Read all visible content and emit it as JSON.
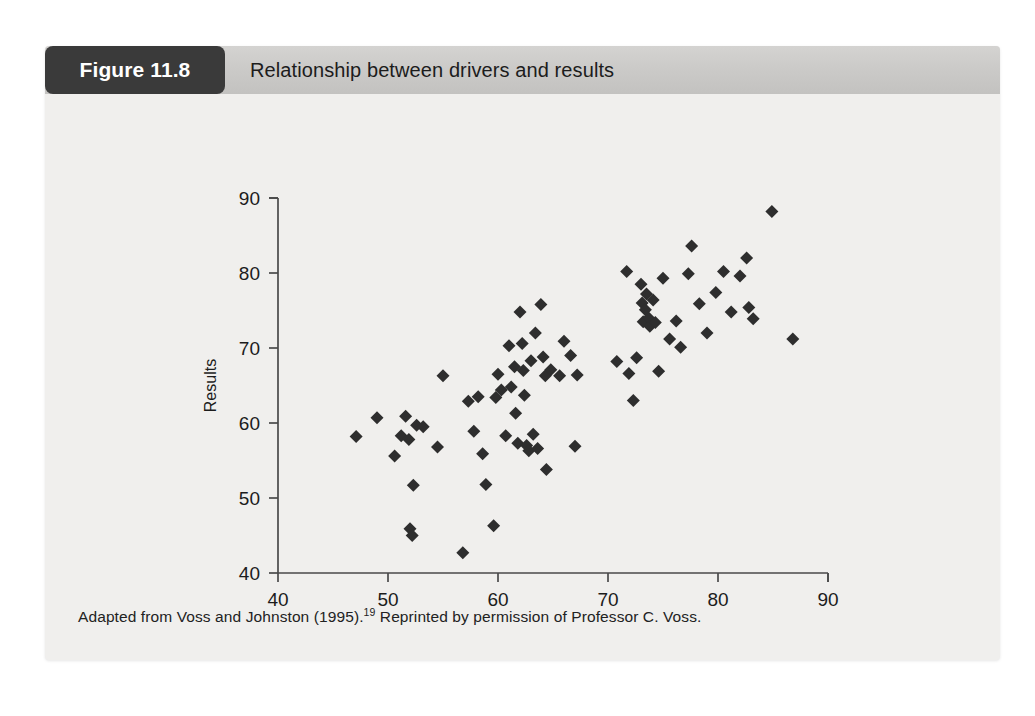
{
  "figure": {
    "badge_label": "Figure 11.8",
    "title": "Relationship between drivers and results",
    "caption_before": "Adapted from Voss and Johnston (1995).",
    "caption_superscript": "19",
    "caption_after": " Reprinted by permission of Professor C. Voss."
  },
  "colors": {
    "panel_background": "#f0efed",
    "header_background": "#cbcac8",
    "badge_background": "#3a3a3a",
    "badge_text": "#ffffff",
    "marker": "#2e2e2e",
    "axis": "#4a4a4a",
    "text": "#1c1c1c"
  },
  "chart_data": {
    "type": "scatter",
    "title": "Relationship between drivers and results",
    "xlabel": "Drivers",
    "ylabel": "Results",
    "xlim": [
      40,
      90
    ],
    "ylim": [
      40,
      90
    ],
    "xticks": [
      40,
      50,
      60,
      70,
      80,
      90
    ],
    "yticks": [
      40,
      50,
      60,
      70,
      80,
      90
    ],
    "xticklabels": [
      "40",
      "50",
      "60",
      "70",
      "80",
      "90"
    ],
    "yticklabels": [
      "40",
      "50",
      "60",
      "70",
      "80",
      "90"
    ],
    "grid": false,
    "legend": false,
    "marker": "diamond",
    "marker_size": 13,
    "series": [
      {
        "name": "Units",
        "points": [
          [
            47.1,
            58.2
          ],
          [
            49.0,
            60.7
          ],
          [
            50.6,
            55.6
          ],
          [
            51.2,
            58.3
          ],
          [
            51.6,
            60.9
          ],
          [
            51.9,
            57.8
          ],
          [
            52.0,
            45.9
          ],
          [
            52.2,
            45.0
          ],
          [
            52.3,
            51.7
          ],
          [
            52.6,
            59.7
          ],
          [
            53.2,
            59.5
          ],
          [
            54.5,
            56.8
          ],
          [
            55.0,
            66.3
          ],
          [
            56.8,
            42.7
          ],
          [
            57.3,
            62.9
          ],
          [
            57.8,
            58.9
          ],
          [
            58.2,
            63.5
          ],
          [
            58.6,
            55.9
          ],
          [
            58.9,
            51.8
          ],
          [
            59.6,
            46.3
          ],
          [
            59.8,
            63.4
          ],
          [
            60.0,
            66.5
          ],
          [
            60.3,
            64.4
          ],
          [
            60.7,
            58.3
          ],
          [
            61.0,
            70.3
          ],
          [
            61.2,
            64.8
          ],
          [
            61.5,
            67.5
          ],
          [
            61.6,
            61.3
          ],
          [
            61.8,
            57.3
          ],
          [
            62.0,
            74.8
          ],
          [
            62.2,
            70.6
          ],
          [
            62.3,
            67.0
          ],
          [
            62.4,
            63.7
          ],
          [
            62.6,
            57.0
          ],
          [
            62.8,
            56.3
          ],
          [
            63.0,
            68.3
          ],
          [
            63.2,
            58.5
          ],
          [
            63.4,
            72.0
          ],
          [
            63.6,
            56.6
          ],
          [
            63.9,
            75.8
          ],
          [
            64.1,
            68.8
          ],
          [
            64.3,
            66.3
          ],
          [
            64.4,
            53.8
          ],
          [
            64.8,
            67.1
          ],
          [
            65.6,
            66.3
          ],
          [
            66.0,
            70.9
          ],
          [
            66.6,
            69.0
          ],
          [
            67.0,
            56.9
          ],
          [
            67.2,
            66.4
          ],
          [
            70.8,
            68.2
          ],
          [
            71.7,
            80.2
          ],
          [
            71.9,
            66.6
          ],
          [
            72.3,
            63.0
          ],
          [
            72.6,
            68.7
          ],
          [
            73.0,
            78.5
          ],
          [
            73.1,
            76.0
          ],
          [
            73.2,
            73.5
          ],
          [
            73.4,
            75.1
          ],
          [
            73.5,
            77.2
          ],
          [
            73.7,
            74.0
          ],
          [
            73.8,
            72.9
          ],
          [
            74.1,
            76.4
          ],
          [
            74.3,
            73.4
          ],
          [
            74.6,
            66.9
          ],
          [
            75.0,
            79.3
          ],
          [
            75.6,
            71.2
          ],
          [
            76.2,
            73.6
          ],
          [
            76.6,
            70.1
          ],
          [
            77.3,
            79.9
          ],
          [
            77.6,
            83.6
          ],
          [
            78.3,
            75.9
          ],
          [
            79.0,
            72.0
          ],
          [
            79.8,
            77.4
          ],
          [
            80.5,
            80.2
          ],
          [
            81.2,
            74.8
          ],
          [
            82.0,
            79.6
          ],
          [
            82.6,
            82.0
          ],
          [
            82.8,
            75.4
          ],
          [
            83.2,
            73.9
          ],
          [
            84.9,
            88.2
          ],
          [
            86.8,
            71.2
          ]
        ]
      }
    ]
  }
}
